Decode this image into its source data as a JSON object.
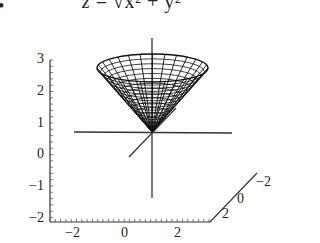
{
  "header": {
    "bullet": "•",
    "equation_lhs": "z",
    "equation_eq": " = ",
    "equation_rhs": "√x² + y²"
  },
  "chart_data": {
    "type": "surface3d",
    "surface": "cone (wireframe mesh)",
    "z_axis": {
      "ticks": [
        "3",
        "2",
        "1",
        "0",
        "−1",
        "−2"
      ],
      "range": [
        -2,
        3
      ]
    },
    "x_axis": {
      "ticks": [
        "−2",
        "0",
        "2"
      ],
      "range": [
        -3,
        3
      ]
    },
    "y_axis": {
      "ticks": [
        "−2",
        "0",
        "2"
      ],
      "range": [
        -3,
        3
      ]
    },
    "apex": [
      0,
      0,
      0
    ],
    "rim_height": 3
  },
  "axes": {
    "z_ticks": [
      {
        "label": "3",
        "y": 60
      },
      {
        "label": "2",
        "y": 92
      },
      {
        "label": "1",
        "y": 124
      },
      {
        "label": "0",
        "y": 155
      },
      {
        "label": "−1",
        "y": 187
      },
      {
        "label": "−2",
        "y": 219
      }
    ],
    "x_ticks": [
      {
        "label": "−2",
        "x": 75
      },
      {
        "label": "0",
        "x": 127
      },
      {
        "label": "2",
        "x": 180
      }
    ],
    "y_ticks": [
      {
        "label": "2",
        "x": 228,
        "y": 215
      },
      {
        "label": "0",
        "x": 243,
        "y": 200
      },
      {
        "label": "−2",
        "x": 262,
        "y": 183
      }
    ]
  }
}
